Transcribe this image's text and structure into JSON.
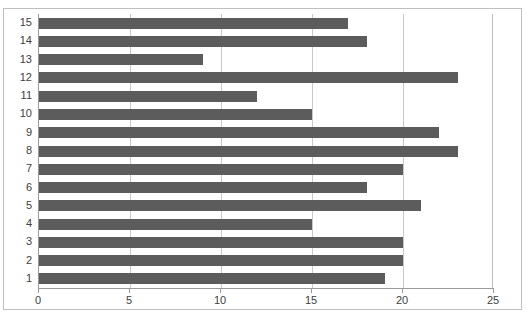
{
  "chart_data": {
    "type": "bar",
    "orientation": "horizontal",
    "title": "",
    "xlabel": "",
    "ylabel": "",
    "categories": [
      "1",
      "2",
      "3",
      "4",
      "5",
      "6",
      "7",
      "8",
      "9",
      "10",
      "11",
      "12",
      "13",
      "14",
      "15"
    ],
    "values": [
      19,
      20,
      20,
      15,
      21,
      18,
      20,
      23,
      22,
      15,
      12,
      23,
      9,
      18,
      17
    ],
    "xlim": [
      0,
      25
    ],
    "xticks": [
      0,
      5,
      10,
      15,
      20,
      25
    ],
    "xtick_labels": [
      "0",
      "5",
      "10",
      "15",
      "20",
      "25"
    ],
    "grid": true,
    "legend": false,
    "bar_color": "#5c5c5c",
    "grid_color": "#c8c8c8",
    "axis_color": "#9a9a9a",
    "border_color": "#bfbfbf"
  }
}
